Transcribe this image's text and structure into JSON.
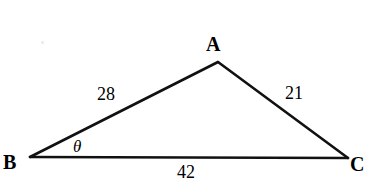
{
  "figure": {
    "type": "triangle-diagram",
    "background_color": "#ffffff",
    "stroke_color": "#111111",
    "width": 371,
    "height": 187,
    "vertices": [
      {
        "name": "A",
        "label": "A",
        "x": 218,
        "y": 62
      },
      {
        "name": "B",
        "label": "B",
        "x": 30,
        "y": 157
      },
      {
        "name": "C",
        "label": "C",
        "x": 348,
        "y": 158
      }
    ],
    "sides": [
      {
        "name": "AB",
        "label": "28",
        "value": 28
      },
      {
        "name": "AC",
        "label": "21",
        "value": 21
      },
      {
        "name": "BC",
        "label": "42",
        "value": 42
      }
    ],
    "angles": [
      {
        "at_vertex": "B",
        "label": "θ",
        "name": "theta"
      }
    ]
  },
  "chart_data": {
    "type": "diagram",
    "title": "",
    "shape": "triangle",
    "vertex_labels": [
      "A",
      "B",
      "C"
    ],
    "side_labels": [
      "28",
      "21",
      "42"
    ],
    "side_values": [
      28,
      21,
      42
    ],
    "angle_labels": [
      "θ"
    ],
    "points": {
      "A": [
        218,
        62
      ],
      "B": [
        30,
        157
      ],
      "C": [
        348,
        158
      ]
    },
    "edges": [
      [
        "B",
        "A"
      ],
      [
        "A",
        "C"
      ],
      [
        "B",
        "C"
      ]
    ],
    "annotations": [
      {
        "text": "28",
        "x": 111,
        "y": 95,
        "describes": "side BA"
      },
      {
        "text": "21",
        "x": 297,
        "y": 94,
        "describes": "side AC"
      },
      {
        "text": "42",
        "x": 189,
        "y": 174,
        "describes": "side BC"
      },
      {
        "text": "θ",
        "x": 80,
        "y": 147,
        "describes": "angle at B"
      }
    ],
    "grid": false,
    "legend": "none"
  }
}
